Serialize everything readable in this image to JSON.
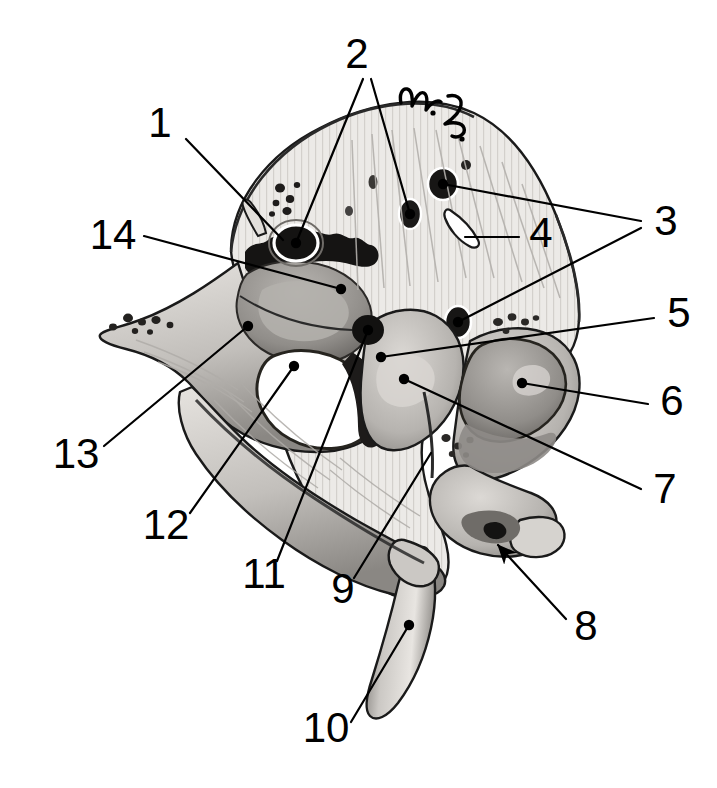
{
  "figure": {
    "title": "Temporal bone, petrous portion — labeled anatomical illustration",
    "signature": "W. L.",
    "background_color": "#ffffff",
    "ink_color": "#000000",
    "label_font_size_px": 42,
    "width_px": 717,
    "height_px": 788
  },
  "labels": [
    {
      "id": "1",
      "text": "1",
      "x": 160,
      "y": 126,
      "anchor": "middle"
    },
    {
      "id": "2",
      "text": "2",
      "x": 357,
      "y": 57,
      "anchor": "middle"
    },
    {
      "id": "3",
      "text": "3",
      "x": 666,
      "y": 224,
      "anchor": "middle"
    },
    {
      "id": "4",
      "text": "4",
      "x": 541,
      "y": 236,
      "anchor": "middle"
    },
    {
      "id": "5",
      "text": "5",
      "x": 679,
      "y": 316,
      "anchor": "middle"
    },
    {
      "id": "6",
      "text": "6",
      "x": 672,
      "y": 404,
      "anchor": "middle"
    },
    {
      "id": "7",
      "text": "7",
      "x": 665,
      "y": 492,
      "anchor": "middle"
    },
    {
      "id": "8",
      "text": "8",
      "x": 586,
      "y": 629,
      "anchor": "middle"
    },
    {
      "id": "9",
      "text": "9",
      "x": 343,
      "y": 592,
      "anchor": "middle"
    },
    {
      "id": "10",
      "text": "10",
      "x": 326,
      "y": 731,
      "anchor": "middle"
    },
    {
      "id": "11",
      "text": "11",
      "x": 264,
      "y": 577,
      "anchor": "middle"
    },
    {
      "id": "12",
      "text": "12",
      "x": 166,
      "y": 528,
      "anchor": "middle"
    },
    {
      "id": "13",
      "text": "13",
      "x": 76,
      "y": 457,
      "anchor": "middle"
    },
    {
      "id": "14",
      "text": "14",
      "x": 113,
      "y": 238,
      "anchor": "middle"
    }
  ],
  "leaders": [
    {
      "label": "1",
      "path": "M 186 139 L 283 240",
      "dot": null
    },
    {
      "label": "2a",
      "path": "M 363 79 L 296 243",
      "dot": [
        296,
        243
      ]
    },
    {
      "label": "2b",
      "path": "M 371 79 L 410 214",
      "dot": [
        410,
        214
      ]
    },
    {
      "label": "3a",
      "path": "M 641 221 L 443 184",
      "dot": [
        443,
        184
      ]
    },
    {
      "label": "3b",
      "path": "M 641 228 L 458 322",
      "dot": [
        458,
        322
      ]
    },
    {
      "label": "4",
      "path": "M 519 237 L 465 237",
      "dot": null
    },
    {
      "label": "5",
      "path": "M 654 318 L 381 357",
      "dot": [
        381,
        357
      ]
    },
    {
      "label": "6",
      "path": "M 648 404 L 522 383",
      "dot": [
        522,
        383
      ]
    },
    {
      "label": "7",
      "path": "M 641 489 L 404 379",
      "dot": [
        404,
        379
      ]
    },
    {
      "label": "8",
      "path": "M 566 619 L 498 545",
      "dot": null,
      "arrow": true
    },
    {
      "label": "9",
      "path": "M 354 578 L 431 453",
      "dot": null
    },
    {
      "label": "10",
      "path": "M 351 722 L 409 625",
      "dot": [
        409,
        625
      ]
    },
    {
      "label": "11",
      "path": "M 277 561 L 368 330",
      "dot": [
        368,
        330
      ]
    },
    {
      "label": "12",
      "path": "M 190 513 L 294 366",
      "dot": [
        294,
        366
      ]
    },
    {
      "label": "13",
      "path": "M 104 446 L 248 326",
      "dot": [
        248,
        326
      ]
    },
    {
      "label": "14",
      "path": "M 144 236 L 341 289",
      "dot": [
        341,
        289
      ]
    }
  ],
  "drawing": {
    "subject": "petrous temporal bone",
    "features": [
      "squamous dome with fine vertical striations",
      "mastoid / petrous ridge with dark serrated suture at upper left",
      "internal acoustic meatus (large dark foramen)",
      "multiple small foramina / canal openings",
      "arcuate eminence and tegmen region",
      "large oval aperture (vestibular / carotid canal opening)",
      "jugular fossa notch at lower right",
      "long tapering styloid process at bottom"
    ],
    "palette": {
      "paper": "#ffffff",
      "bone_light": "#eceae7",
      "bone_mid": "#c9c6c2",
      "bone_shadow": "#8f8c88",
      "bone_dark": "#5a5754",
      "ink": "#1a1a1a"
    }
  }
}
